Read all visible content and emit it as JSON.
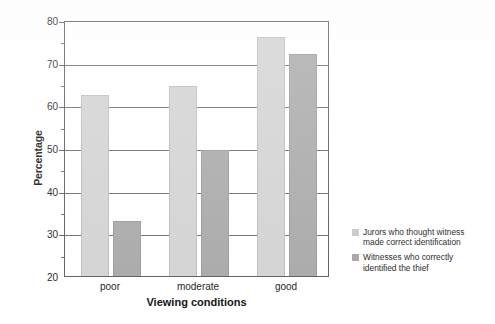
{
  "chart_data": {
    "type": "bar",
    "title": "",
    "xlabel": "Viewing conditions",
    "ylabel": "Percentage",
    "categories": [
      "poor",
      "moderate",
      "good"
    ],
    "series": [
      {
        "name": "Jurors who thought witness made correct identification",
        "color": "#d3d3d3",
        "values": [
          62.5,
          64.5,
          76.0
        ]
      },
      {
        "name": "Witnesses who correctly identified the thief",
        "color": "#a9a9a9",
        "values": [
          33.0,
          49.5,
          72.0
        ]
      }
    ],
    "ylim": [
      20,
      80
    ],
    "yticks": [
      20,
      30,
      40,
      50,
      60,
      70,
      80
    ],
    "ytick_labels": [
      "20",
      "30",
      "40",
      "50",
      "60",
      "70",
      "80"
    ],
    "grid": true,
    "legend_position": "right-bottom"
  },
  "legend": {
    "items": [
      {
        "label_line1": "Jurors who thought witness",
        "label_line2": "made correct identification",
        "swatch": "light"
      },
      {
        "label_line1": "Witnesses who correctly",
        "label_line2": "identified the thief",
        "swatch": "dark"
      }
    ]
  },
  "axes": {
    "y_title": "Percentage",
    "x_title": "Viewing conditions",
    "y_tick_20": "20",
    "y_tick_30": "30",
    "y_tick_40": "40",
    "y_tick_50": "50",
    "y_tick_60": "60",
    "y_tick_70": "70",
    "y_tick_80": "80",
    "x_tick_poor": "poor",
    "x_tick_moderate": "moderate",
    "x_tick_good": "good"
  }
}
